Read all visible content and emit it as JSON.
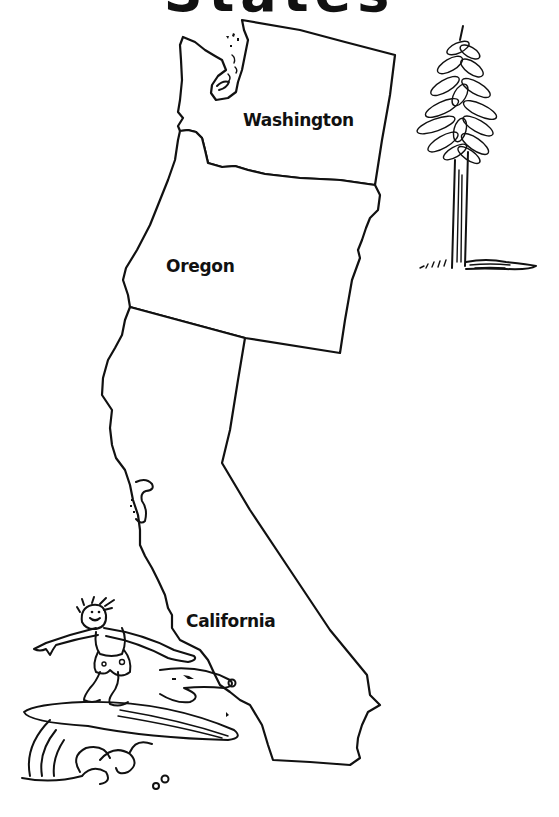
{
  "title": {
    "text": "States",
    "note": "partially cropped at top edge"
  },
  "map": {
    "region": "West Coast",
    "states": [
      {
        "name": "Washington",
        "label": "Washington"
      },
      {
        "name": "Oregon",
        "label": "Oregon"
      },
      {
        "name": "California",
        "label": "California"
      }
    ]
  },
  "illustrations": [
    {
      "name": "redwood-tree",
      "description": "Tall conifer tree drawing beside Washington/Oregon"
    },
    {
      "name": "surfer",
      "description": "Cartoon surfer riding a wave off the Southern California coast"
    }
  ],
  "colors": {
    "ink": "#111111",
    "paper": "#ffffff"
  }
}
